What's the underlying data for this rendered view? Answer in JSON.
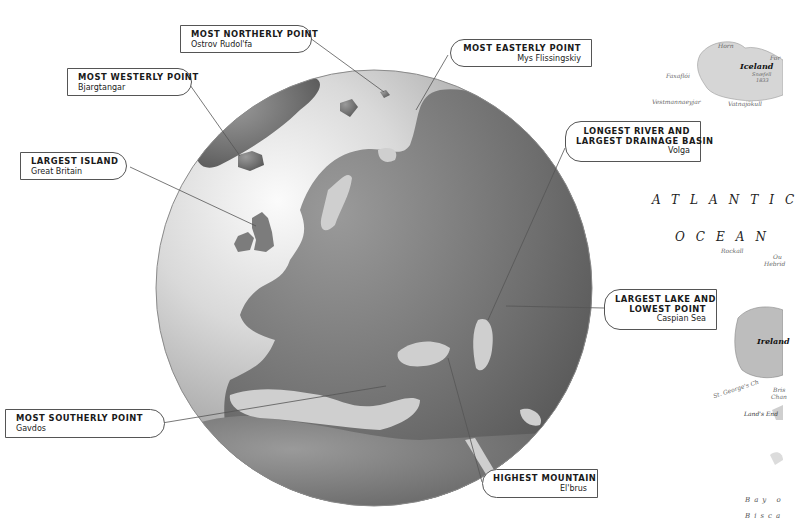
{
  "callouts": {
    "northerly": {
      "title": "MOST NORTHERLY POINT",
      "subtitle": "Ostrov Rudol'fa"
    },
    "westerly": {
      "title": "MOST WESTERLY POINT",
      "subtitle": "Bjargtangar"
    },
    "easterly": {
      "title": "MOST EASTERLY POINT",
      "subtitle": "Mys Flissingskiy"
    },
    "river": {
      "title_line1": "LONGEST RIVER AND",
      "title_line2": "LARGEST DRAINAGE BASIN",
      "subtitle": "Volga"
    },
    "island": {
      "title": "LARGEST ISLAND",
      "subtitle": "Great Britain"
    },
    "lake": {
      "title_line1": "LARGEST LAKE AND",
      "title_line2": "LOWEST POINT",
      "subtitle": "Caspian Sea"
    },
    "southerly": {
      "title": "MOST SOUTHERLY POINT",
      "subtitle": "Gavdos"
    },
    "mountain": {
      "title": "HIGHEST MOUNTAIN",
      "subtitle": "El'brus"
    }
  },
  "inset_map": {
    "ocean_line1": "ATLANTIC",
    "ocean_line2": "OCEAN",
    "labels": {
      "horn": "Horn",
      "iceland": "Iceland",
      "faxafloi": "Faxaflói",
      "vestmannaeyjar": "Vestmannaeyjar",
      "snaefell": "Snæfell",
      "snaefell_elev": "1833",
      "vatnajokull": "Vatnajökull",
      "for": "For",
      "rockall": "Rockall",
      "outer_hebrides_1": "Ou",
      "outer_hebrides_2": "Hebrid",
      "ireland": "Ireland",
      "st_georges": "St. George's Ch",
      "bristol_1": "Bris",
      "bristol_2": "Chan",
      "lands_end": "Land's End",
      "bay_1": "Bay o",
      "bay_2": "Bisca"
    }
  },
  "colors": {
    "land": "#7a7a7a",
    "globe_light": "#f4f4f4",
    "globe_dark": "#5e5e5e",
    "leader": "#555555"
  }
}
